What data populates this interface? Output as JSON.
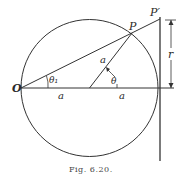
{
  "figure": {
    "caption": "Fig. 6.20.",
    "labels": {
      "origin": "O",
      "point_p": "P",
      "point_p_prime": "P′",
      "radius_r": "r",
      "theta_1": "θ₁",
      "theta": "θ",
      "a_left": "a",
      "a_right": "a",
      "a_radius": "a"
    },
    "colors": {
      "stroke": "#333333",
      "background": "#ffffff"
    }
  }
}
